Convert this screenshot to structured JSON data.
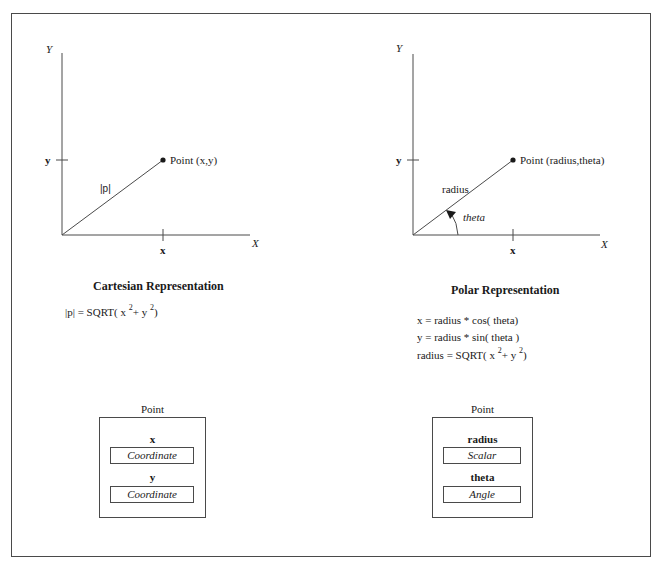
{
  "cartesian": {
    "axis_y_label": "Y",
    "axis_x_label": "X",
    "tick_y_label": "y",
    "tick_x_label": "x",
    "point_label": "Point (x,y)",
    "vector_label": "|p|",
    "heading": "Cartesian Representation",
    "formula": {
      "prefix": "|p| = SQRT( x ",
      "exp1": "2",
      "mid": "+   y ",
      "exp2": "2",
      "suffix": ")"
    },
    "class_box": {
      "title": "Point",
      "fields": [
        {
          "name": "x",
          "type": "Coordinate"
        },
        {
          "name": "y",
          "type": "Coordinate"
        }
      ]
    }
  },
  "polar": {
    "axis_y_label": "Y",
    "axis_x_label": "X",
    "tick_y_label": "y",
    "tick_x_label": "x",
    "point_label": "Point (radius,theta)",
    "vector_label": "radius",
    "angle_label": "theta",
    "heading": "Polar Representation",
    "formulas": [
      "x = radius * cos( theta)",
      "y = radius * sin( theta )"
    ],
    "formula3": {
      "prefix": "radius = SQRT( x  ",
      "exp1": "2",
      "mid": "+  y ",
      "exp2": "2",
      "suffix": ")"
    },
    "class_box": {
      "title": "Point",
      "fields": [
        {
          "name": "radius",
          "type": "Scalar"
        },
        {
          "name": "theta",
          "type": "Angle"
        }
      ]
    }
  },
  "colors": {
    "line": "#4a4a4a",
    "text": "#1a1a1a",
    "background": "#ffffff"
  }
}
